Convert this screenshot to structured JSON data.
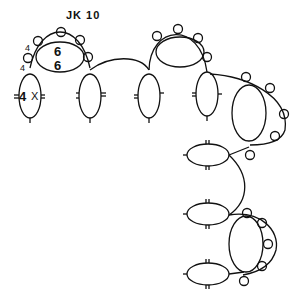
{
  "diagram": {
    "type": "tatting-pattern",
    "title": "JK 10",
    "labels": {
      "picot_count_1": "4",
      "picot_count_2": "4",
      "ring_stitch_top": "6",
      "ring_stitch_bottom": "6",
      "repeat": "4",
      "repeat_x": "X"
    },
    "colors": {
      "line": "#111111",
      "background": "#ffffff"
    }
  }
}
